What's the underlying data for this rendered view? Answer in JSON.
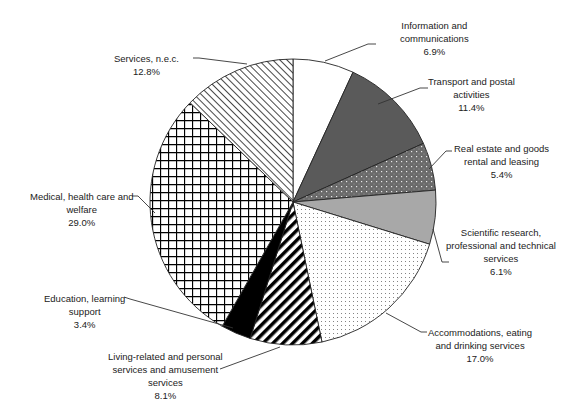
{
  "chart_data": {
    "type": "pie",
    "title": "",
    "start_angle": "12 o'clock",
    "direction": "clockwise",
    "slices": [
      {
        "label": "Information and communications",
        "value": 6.9,
        "display": "6.9%",
        "fill": "#ffffff",
        "pattern": "none"
      },
      {
        "label": "Transport and postal activities",
        "value": 11.4,
        "display": "11.4%",
        "fill": "#5a5a5a",
        "pattern": "solid-dark-gray"
      },
      {
        "label": "Real estate and goods rental and leasing",
        "value": 5.4,
        "display": "5.4%",
        "fill": "#6e6e6e",
        "pattern": "dotted-dark"
      },
      {
        "label": "Scientific research, professional and technical services",
        "value": 6.1,
        "display": "6.1%",
        "fill": "#a8a8a8",
        "pattern": "solid-light-gray"
      },
      {
        "label": "Accommodations, eating and drinking services",
        "value": 17.0,
        "display": "17.0%",
        "fill": "#ffffff",
        "pattern": "fine-dots"
      },
      {
        "label": "Living-related and personal services and amusement services",
        "value": 8.1,
        "display": "8.1%",
        "fill": "#ffffff",
        "pattern": "bold-diagonal-stripes"
      },
      {
        "label": "Education, learning support",
        "value": 3.4,
        "display": "3.4%",
        "fill": "#000000",
        "pattern": "solid-black"
      },
      {
        "label": "Medical, health care and welfare",
        "value": 29.0,
        "display": "29.0%",
        "fill": "#ffffff",
        "pattern": "grid"
      },
      {
        "label": "Services, n.e.c.",
        "value": 12.8,
        "display": "12.8%",
        "fill": "#ffffff",
        "pattern": "thin-diagonal-hatch"
      }
    ]
  },
  "labels": {
    "info": {
      "line1": "Information and",
      "line2": "communications",
      "pct": "6.9%"
    },
    "transport": {
      "line1": "Transport and postal",
      "line2": "activities",
      "pct": "11.4%"
    },
    "realestate": {
      "line1": "Real estate and goods",
      "line2": "rental and leasing",
      "pct": "5.4%"
    },
    "scientific": {
      "line1": "Scientific research,",
      "line2": "professional and technical",
      "line3": "services",
      "pct": "6.1%"
    },
    "accommodations": {
      "line1": "Accommodations, eating",
      "line2": "and drinking services",
      "pct": "17.0%"
    },
    "living": {
      "line1": "Living-related and personal",
      "line2": "services and amusement",
      "line3": "services",
      "pct": "8.1%"
    },
    "education": {
      "line1": "Education, learning",
      "line2": "support",
      "pct": "3.4%"
    },
    "medical": {
      "line1": "Medical, health care and",
      "line2": "welfare",
      "pct": "29.0%"
    },
    "services": {
      "line1": "Services, n.e.c.",
      "pct": "12.8%"
    }
  }
}
